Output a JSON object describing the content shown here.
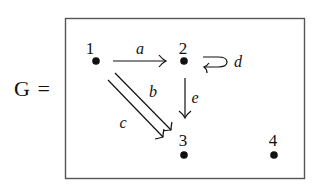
{
  "graph": {
    "name_label": "G =",
    "colors": {
      "ink": "#111111",
      "frame": "#555555",
      "background": "#ffffff"
    },
    "nodes": [
      {
        "id": "1",
        "label": "1"
      },
      {
        "id": "2",
        "label": "2"
      },
      {
        "id": "3",
        "label": "3"
      },
      {
        "id": "4",
        "label": "4"
      }
    ],
    "edges": [
      {
        "id": "a",
        "label": "a",
        "from": "1",
        "to": "2",
        "style": "single-arrow"
      },
      {
        "id": "b",
        "label": "b",
        "from": "1",
        "to": "3",
        "style": "single-arrow"
      },
      {
        "id": "c",
        "label": "c",
        "from": "1",
        "to": "3",
        "style": "single-arrow"
      },
      {
        "id": "d",
        "label": "d",
        "from": "2",
        "to": "2",
        "style": "self-loop"
      },
      {
        "id": "e",
        "label": "e",
        "from": "2",
        "to": "3",
        "style": "single-arrow"
      }
    ]
  }
}
